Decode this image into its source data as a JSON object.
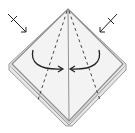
{
  "diagram": {
    "type": "origami-fold-step",
    "description": "Diamond-shaped folded paper with center crease, two dashed valley-fold lines, two curved arrows folding flaps to center, and two crossed push arrows at upper corners",
    "colors": {
      "paper": "#f2f2f2",
      "paper_edge": "#9a9a9a",
      "line": "#333333",
      "background": "#ffffff"
    },
    "elements": {
      "paper": "diamond-paper",
      "center_crease": "center-crease-line",
      "fold_lines": [
        "left-valley-fold",
        "right-valley-fold"
      ],
      "arrows": [
        "left-fold-arrow",
        "right-fold-arrow",
        "left-push-arrow",
        "right-push-arrow"
      ]
    }
  }
}
